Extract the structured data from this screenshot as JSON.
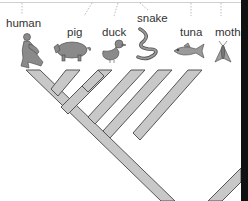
{
  "diagram": {
    "type": "cladogram",
    "taxa": [
      {
        "label": "human",
        "icon": "human-icon"
      },
      {
        "label": "pig",
        "icon": "pig-icon"
      },
      {
        "label": "duck",
        "icon": "duck-icon"
      },
      {
        "label": "snake",
        "icon": "snake-icon"
      },
      {
        "label": "tuna",
        "icon": "tuna-icon"
      },
      {
        "label": "moth",
        "icon": "moth-icon"
      }
    ],
    "colors": {
      "branch_fill": "#c8c8c8",
      "branch_stroke": "#555555",
      "label": "#333333",
      "leader_line": "#aaaaaa"
    }
  }
}
